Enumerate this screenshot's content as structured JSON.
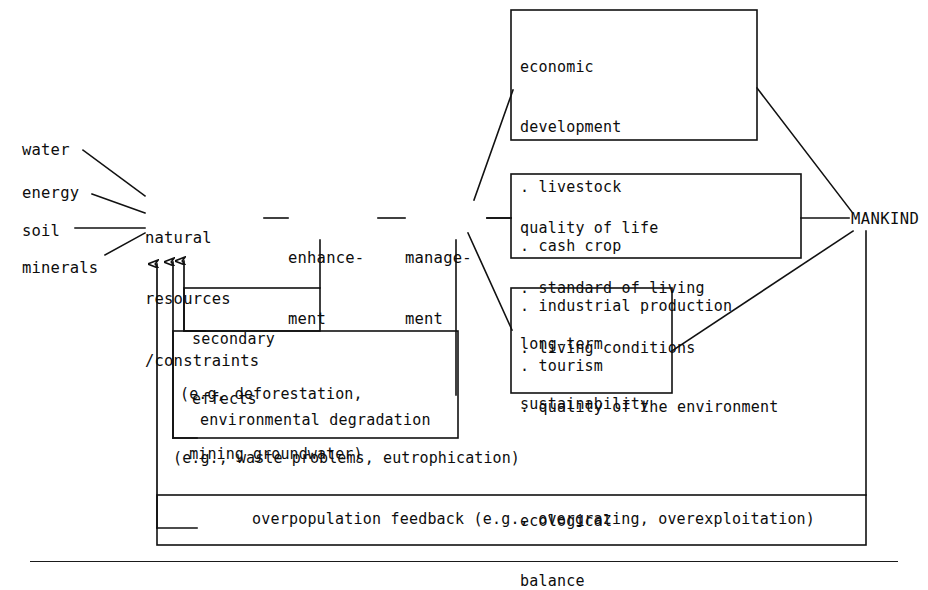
{
  "diagram": {
    "ink_color": "#111111",
    "background": "#ffffff",
    "inputs": [
      {
        "id": "water",
        "label": "water"
      },
      {
        "id": "energy",
        "label": "energy"
      },
      {
        "id": "soil",
        "label": "soil"
      },
      {
        "id": "minerals",
        "label": "minerals"
      }
    ],
    "core_nodes": {
      "resources": {
        "line1": "natural",
        "line2": "resources",
        "line3": "/constraints"
      },
      "enhancement": {
        "line1": "enhance-",
        "line2": "ment"
      },
      "management": {
        "line1": "manage-",
        "line2": "ment"
      },
      "mankind": {
        "label": "MANKIND"
      }
    },
    "outcome_boxes": [
      {
        "id": "economic-development",
        "heading_line1": "economic",
        "heading_line2": "development",
        "bullets": [
          ". livestock",
          ". cash crop",
          ". industrial production",
          ". tourism"
        ]
      },
      {
        "id": "quality-of-life",
        "heading_line1": "quality of life",
        "heading_line2": "",
        "bullets": [
          ". standard of living",
          ". living conditions",
          ". quality of the environment"
        ]
      },
      {
        "id": "long-term-sustainability",
        "heading_line1": "long-term",
        "heading_line2": "sustainability",
        "bullets": [
          "",
          "ecological",
          "balance"
        ]
      }
    ],
    "feedback_boxes": [
      {
        "id": "secondary-effects",
        "line1": "secondary",
        "line2": "effects"
      },
      {
        "id": "environmental-degradation",
        "line1": "environmental degradation",
        "line2": ""
      },
      {
        "id": "overpopulation-feedback",
        "line1": "overpopulation feedback (e.g., overgrazing, overexploitation)",
        "line2": ""
      }
    ],
    "notes": [
      {
        "id": "note-secondary",
        "line1": "(e.g, deforestation,",
        "line2": " mining groundwater)"
      },
      {
        "id": "note-degradation",
        "line1": "(e.g., waste problems, eutrophication)",
        "line2": ""
      }
    ]
  }
}
